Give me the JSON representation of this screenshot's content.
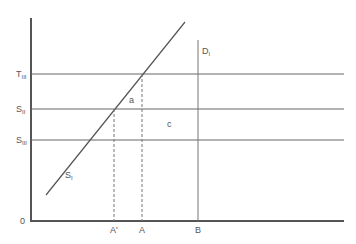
{
  "diagram": {
    "colors": {
      "axis": "#555555",
      "line": "#666666",
      "text": "#555555",
      "background": "#ffffff"
    },
    "y_labels": {
      "t3": {
        "main": "T",
        "sub": "III"
      },
      "s2": {
        "main": "S",
        "sub": "II"
      },
      "s3": {
        "main": "S",
        "sub": "III"
      },
      "origin": "0"
    },
    "x_labels": {
      "a_prime": "A'",
      "a": "A",
      "b": "B"
    },
    "curve_labels": {
      "supply": {
        "main": "S",
        "sub": "I"
      },
      "demand": {
        "main": "D",
        "sub": "I"
      }
    },
    "region_labels": {
      "a": "a",
      "c": "c"
    }
  }
}
